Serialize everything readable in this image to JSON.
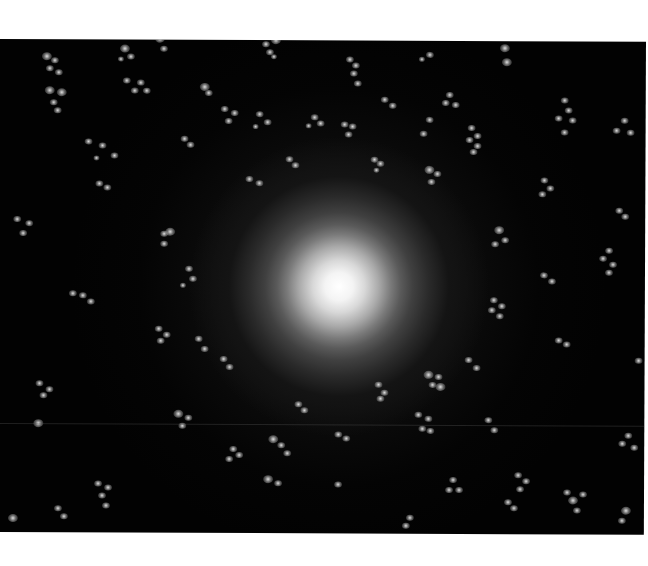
{
  "image": {
    "description": "Grayscale fluorescence-style image: bright central glow surrounded by concentric faint rings and scattered clusters of bright dots on a black background, framed by white margins",
    "background_color": "#020202",
    "margin_color": "#ffffff",
    "center": {
      "x": 340,
      "y": 246
    },
    "scanline_y": 384,
    "rings": [
      {
        "r": 48,
        "w": 3
      },
      {
        "r": 64,
        "w": 4
      },
      {
        "r": 80,
        "w": 3
      },
      {
        "r": 96,
        "w": 2
      }
    ],
    "clusters": [
      {
        "x": 55,
        "y": 22,
        "dots": [
          [
            -8,
            -4,
            4
          ],
          [
            0,
            0,
            3
          ],
          [
            -5,
            8,
            3
          ],
          [
            4,
            12,
            3
          ]
        ]
      },
      {
        "x": 125,
        "y": 10,
        "dots": [
          [
            0,
            0,
            4
          ],
          [
            6,
            8,
            3
          ],
          [
            -4,
            10,
            2
          ]
        ]
      },
      {
        "x": 160,
        "y": 0,
        "dots": [
          [
            0,
            0,
            4
          ],
          [
            4,
            10,
            3
          ]
        ]
      },
      {
        "x": 68,
        "y": 60,
        "dots": [
          [
            -18,
            -8,
            4
          ],
          [
            -6,
            -6,
            4
          ],
          [
            -14,
            4,
            3
          ],
          [
            -10,
            12,
            3
          ]
        ]
      },
      {
        "x": 133,
        "y": 42,
        "dots": [
          [
            -6,
            0,
            3
          ],
          [
            8,
            2,
            3
          ],
          [
            2,
            10,
            3
          ],
          [
            14,
            10,
            3
          ]
        ]
      },
      {
        "x": 205,
        "y": 48,
        "dots": [
          [
            0,
            0,
            4
          ],
          [
            4,
            6,
            3
          ]
        ]
      },
      {
        "x": 95,
        "y": 103,
        "dots": [
          [
            -6,
            0,
            3
          ],
          [
            8,
            4,
            3
          ],
          [
            20,
            14,
            3
          ],
          [
            2,
            16,
            2
          ]
        ]
      },
      {
        "x": 185,
        "y": 100,
        "dots": [
          [
            0,
            0,
            3
          ],
          [
            6,
            6,
            3
          ]
        ]
      },
      {
        "x": 270,
        "y": 5,
        "dots": [
          [
            -4,
            0,
            3
          ],
          [
            6,
            -4,
            4
          ],
          [
            0,
            8,
            3
          ],
          [
            4,
            12,
            2
          ]
        ]
      },
      {
        "x": 350,
        "y": 20,
        "dots": [
          [
            0,
            0,
            3
          ],
          [
            6,
            6,
            3
          ],
          [
            4,
            14,
            3
          ],
          [
            8,
            24,
            3
          ]
        ]
      },
      {
        "x": 430,
        "y": 15,
        "dots": [
          [
            0,
            0,
            3
          ],
          [
            -8,
            4,
            2
          ]
        ]
      },
      {
        "x": 505,
        "y": 8,
        "dots": [
          [
            0,
            0,
            4
          ],
          [
            2,
            14,
            4
          ]
        ]
      },
      {
        "x": 450,
        "y": 55,
        "dots": [
          [
            0,
            0,
            3
          ],
          [
            -4,
            8,
            3
          ],
          [
            6,
            10,
            3
          ]
        ]
      },
      {
        "x": 565,
        "y": 60,
        "dots": [
          [
            0,
            0,
            3
          ],
          [
            4,
            10,
            3
          ],
          [
            -6,
            18,
            3
          ],
          [
            8,
            20,
            3
          ],
          [
            0,
            32,
            3
          ]
        ]
      },
      {
        "x": 430,
        "y": 80,
        "dots": [
          [
            0,
            0,
            3
          ],
          [
            -6,
            14,
            3
          ]
        ]
      },
      {
        "x": 472,
        "y": 88,
        "dots": [
          [
            0,
            0,
            3
          ],
          [
            6,
            8,
            3
          ]
        ]
      },
      {
        "x": 625,
        "y": 80,
        "dots": [
          [
            0,
            0,
            3
          ],
          [
            -8,
            10,
            3
          ],
          [
            6,
            12,
            3
          ]
        ]
      },
      {
        "x": 225,
        "y": 70,
        "dots": [
          [
            0,
            0,
            3
          ],
          [
            10,
            4,
            3
          ],
          [
            4,
            12,
            3
          ]
        ]
      },
      {
        "x": 260,
        "y": 75,
        "dots": [
          [
            0,
            0,
            3
          ],
          [
            8,
            8,
            3
          ],
          [
            -4,
            12,
            2
          ]
        ]
      },
      {
        "x": 315,
        "y": 78,
        "dots": [
          [
            0,
            0,
            3
          ],
          [
            6,
            6,
            3
          ],
          [
            -6,
            8,
            2
          ]
        ]
      },
      {
        "x": 345,
        "y": 85,
        "dots": [
          [
            0,
            0,
            3
          ],
          [
            8,
            2,
            3
          ],
          [
            4,
            10,
            3
          ]
        ]
      },
      {
        "x": 385,
        "y": 60,
        "dots": [
          [
            0,
            0,
            3
          ],
          [
            8,
            6,
            3
          ]
        ]
      },
      {
        "x": 430,
        "y": 130,
        "dots": [
          [
            0,
            0,
            4
          ],
          [
            8,
            4,
            3
          ],
          [
            2,
            12,
            3
          ]
        ]
      },
      {
        "x": 250,
        "y": 140,
        "dots": [
          [
            0,
            0,
            3
          ],
          [
            10,
            4,
            3
          ]
        ]
      },
      {
        "x": 290,
        "y": 120,
        "dots": [
          [
            0,
            0,
            3
          ],
          [
            6,
            6,
            3
          ]
        ]
      },
      {
        "x": 375,
        "y": 120,
        "dots": [
          [
            0,
            0,
            3
          ],
          [
            6,
            4,
            3
          ],
          [
            2,
            10,
            2
          ]
        ]
      },
      {
        "x": 470,
        "y": 100,
        "dots": [
          [
            0,
            0,
            3
          ],
          [
            8,
            6,
            3
          ],
          [
            4,
            12,
            3
          ]
        ]
      },
      {
        "x": 545,
        "y": 140,
        "dots": [
          [
            0,
            0,
            3
          ],
          [
            6,
            8,
            3
          ],
          [
            -2,
            14,
            3
          ]
        ]
      },
      {
        "x": 22,
        "y": 185,
        "dots": [
          [
            -4,
            -4,
            3
          ],
          [
            8,
            0,
            3
          ],
          [
            2,
            10,
            3
          ]
        ]
      },
      {
        "x": 100,
        "y": 145,
        "dots": [
          [
            0,
            0,
            3
          ],
          [
            8,
            4,
            3
          ]
        ]
      },
      {
        "x": 165,
        "y": 195,
        "dots": [
          [
            0,
            0,
            3
          ],
          [
            6,
            -2,
            4
          ],
          [
            0,
            10,
            3
          ]
        ]
      },
      {
        "x": 80,
        "y": 255,
        "dots": [
          [
            -6,
            0,
            3
          ],
          [
            4,
            2,
            3
          ],
          [
            12,
            8,
            3
          ]
        ]
      },
      {
        "x": 190,
        "y": 230,
        "dots": [
          [
            0,
            0,
            3
          ],
          [
            4,
            10,
            3
          ],
          [
            -6,
            16,
            2
          ]
        ]
      },
      {
        "x": 160,
        "y": 290,
        "dots": [
          [
            0,
            0,
            3
          ],
          [
            8,
            6,
            3
          ],
          [
            2,
            12,
            3
          ]
        ]
      },
      {
        "x": 200,
        "y": 300,
        "dots": [
          [
            0,
            0,
            3
          ],
          [
            6,
            10,
            3
          ]
        ]
      },
      {
        "x": 500,
        "y": 190,
        "dots": [
          [
            0,
            0,
            4
          ],
          [
            6,
            10,
            3
          ],
          [
            -4,
            14,
            3
          ]
        ]
      },
      {
        "x": 495,
        "y": 260,
        "dots": [
          [
            0,
            0,
            3
          ],
          [
            8,
            6,
            3
          ],
          [
            -2,
            10,
            3
          ],
          [
            6,
            16,
            3
          ]
        ]
      },
      {
        "x": 470,
        "y": 320,
        "dots": [
          [
            0,
            0,
            3
          ],
          [
            8,
            8,
            3
          ]
        ]
      },
      {
        "x": 545,
        "y": 235,
        "dots": [
          [
            0,
            0,
            3
          ],
          [
            8,
            6,
            3
          ]
        ]
      },
      {
        "x": 610,
        "y": 210,
        "dots": [
          [
            0,
            0,
            3
          ],
          [
            -6,
            8,
            3
          ],
          [
            4,
            14,
            3
          ],
          [
            0,
            22,
            3
          ]
        ]
      },
      {
        "x": 620,
        "y": 170,
        "dots": [
          [
            0,
            0,
            3
          ],
          [
            6,
            6,
            3
          ]
        ]
      },
      {
        "x": 560,
        "y": 300,
        "dots": [
          [
            0,
            0,
            3
          ],
          [
            8,
            4,
            3
          ]
        ]
      },
      {
        "x": 45,
        "y": 345,
        "dots": [
          [
            -4,
            0,
            3
          ],
          [
            6,
            6,
            3
          ],
          [
            0,
            12,
            3
          ]
        ]
      },
      {
        "x": 40,
        "y": 385,
        "dots": [
          [
            0,
            0,
            4
          ]
        ]
      },
      {
        "x": 180,
        "y": 375,
        "dots": [
          [
            0,
            0,
            4
          ],
          [
            10,
            4,
            3
          ],
          [
            4,
            12,
            3
          ]
        ]
      },
      {
        "x": 225,
        "y": 320,
        "dots": [
          [
            0,
            0,
            3
          ],
          [
            6,
            8,
            3
          ]
        ]
      },
      {
        "x": 235,
        "y": 410,
        "dots": [
          [
            0,
            0,
            3
          ],
          [
            6,
            6,
            3
          ],
          [
            -4,
            10,
            3
          ]
        ]
      },
      {
        "x": 100,
        "y": 445,
        "dots": [
          [
            0,
            0,
            3
          ],
          [
            10,
            4,
            3
          ],
          [
            4,
            12,
            3
          ],
          [
            8,
            22,
            3
          ]
        ]
      },
      {
        "x": 275,
        "y": 400,
        "dots": [
          [
            0,
            0,
            4
          ],
          [
            8,
            6,
            3
          ],
          [
            14,
            14,
            3
          ]
        ]
      },
      {
        "x": 270,
        "y": 440,
        "dots": [
          [
            0,
            0,
            4
          ],
          [
            10,
            4,
            3
          ]
        ]
      },
      {
        "x": 300,
        "y": 365,
        "dots": [
          [
            0,
            0,
            3
          ],
          [
            6,
            6,
            3
          ]
        ]
      },
      {
        "x": 340,
        "y": 395,
        "dots": [
          [
            0,
            0,
            3
          ],
          [
            8,
            4,
            3
          ]
        ]
      },
      {
        "x": 340,
        "y": 445,
        "dots": [
          [
            0,
            0,
            3
          ]
        ]
      },
      {
        "x": 380,
        "y": 345,
        "dots": [
          [
            0,
            0,
            3
          ],
          [
            6,
            8,
            3
          ],
          [
            2,
            14,
            3
          ]
        ]
      },
      {
        "x": 420,
        "y": 375,
        "dots": [
          [
            0,
            0,
            3
          ],
          [
            10,
            4,
            3
          ],
          [
            4,
            14,
            3
          ],
          [
            12,
            16,
            3
          ]
        ]
      },
      {
        "x": 430,
        "y": 335,
        "dots": [
          [
            0,
            0,
            4
          ],
          [
            10,
            2,
            3
          ],
          [
            4,
            10,
            3
          ],
          [
            12,
            12,
            4
          ]
        ]
      },
      {
        "x": 490,
        "y": 380,
        "dots": [
          [
            0,
            0,
            3
          ],
          [
            6,
            10,
            3
          ]
        ]
      },
      {
        "x": 455,
        "y": 440,
        "dots": [
          [
            0,
            0,
            3
          ],
          [
            -4,
            10,
            3
          ],
          [
            6,
            10,
            3
          ]
        ]
      },
      {
        "x": 510,
        "y": 462,
        "dots": [
          [
            0,
            0,
            3
          ],
          [
            6,
            6,
            3
          ]
        ]
      },
      {
        "x": 412,
        "y": 478,
        "dots": [
          [
            0,
            0,
            3
          ],
          [
            -4,
            8,
            3
          ]
        ]
      },
      {
        "x": 520,
        "y": 435,
        "dots": [
          [
            0,
            0,
            3
          ],
          [
            8,
            6,
            3
          ],
          [
            2,
            14,
            3
          ]
        ]
      },
      {
        "x": 575,
        "y": 460,
        "dots": [
          [
            0,
            0,
            4
          ],
          [
            -6,
            -8,
            3
          ],
          [
            10,
            -6,
            3
          ],
          [
            4,
            10,
            3
          ]
        ]
      },
      {
        "x": 630,
        "y": 395,
        "dots": [
          [
            0,
            0,
            3
          ],
          [
            -6,
            8,
            3
          ],
          [
            6,
            12,
            3
          ]
        ]
      },
      {
        "x": 640,
        "y": 320,
        "dots": [
          [
            0,
            0,
            3
          ]
        ]
      },
      {
        "x": 15,
        "y": 480,
        "dots": [
          [
            0,
            0,
            4
          ]
        ]
      },
      {
        "x": 60,
        "y": 470,
        "dots": [
          [
            0,
            0,
            3
          ],
          [
            6,
            8,
            3
          ]
        ]
      },
      {
        "x": 628,
        "y": 470,
        "dots": [
          [
            0,
            0,
            4
          ],
          [
            -4,
            10,
            3
          ]
        ]
      }
    ]
  }
}
